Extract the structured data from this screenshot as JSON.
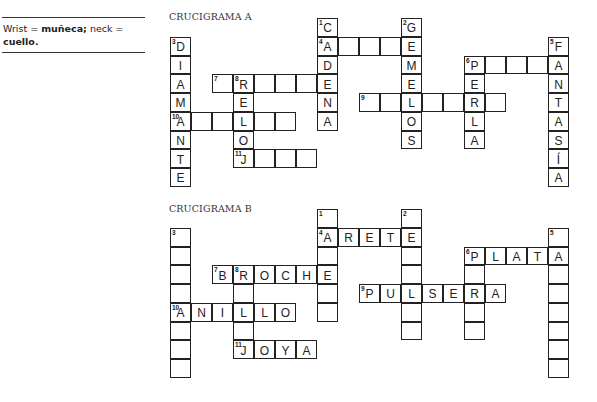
{
  "note": {
    "text_parts": [
      {
        "t": "Wrist = ",
        "bold": false
      },
      {
        "t": "muñeca;",
        "bold": true
      },
      {
        "t": " neck = ",
        "bold": false
      },
      {
        "t": "cuello.",
        "bold": true
      }
    ]
  },
  "puzzles": [
    {
      "title": "CRUCIGRAMA A",
      "title_top": 11,
      "origin": {
        "x": 170,
        "y": 18
      },
      "cells": [
        [
          0,
          7,
          "C",
          "1"
        ],
        [
          1,
          7,
          "A",
          "4"
        ],
        [
          2,
          7,
          "D",
          ""
        ],
        [
          3,
          7,
          "E",
          ""
        ],
        [
          4,
          7,
          "N",
          ""
        ],
        [
          5,
          7,
          "A",
          ""
        ],
        [
          1,
          8,
          "",
          ""
        ],
        [
          1,
          9,
          "",
          ""
        ],
        [
          1,
          10,
          "",
          ""
        ],
        [
          0,
          11,
          "G",
          "2"
        ],
        [
          1,
          11,
          "E",
          ""
        ],
        [
          2,
          11,
          "M",
          ""
        ],
        [
          3,
          11,
          "E",
          ""
        ],
        [
          4,
          11,
          "L",
          ""
        ],
        [
          5,
          11,
          "O",
          ""
        ],
        [
          6,
          11,
          "S",
          ""
        ],
        [
          1,
          0,
          "D",
          "3"
        ],
        [
          2,
          0,
          "I",
          ""
        ],
        [
          3,
          0,
          "A",
          ""
        ],
        [
          4,
          0,
          "M",
          ""
        ],
        [
          5,
          0,
          "A",
          "10"
        ],
        [
          6,
          0,
          "N",
          ""
        ],
        [
          7,
          0,
          "T",
          ""
        ],
        [
          8,
          0,
          "E",
          ""
        ],
        [
          1,
          18,
          "F",
          "5"
        ],
        [
          2,
          18,
          "A",
          ""
        ],
        [
          3,
          18,
          "N",
          ""
        ],
        [
          4,
          18,
          "T",
          ""
        ],
        [
          5,
          18,
          "A",
          ""
        ],
        [
          6,
          18,
          "S",
          ""
        ],
        [
          7,
          18,
          "Í",
          ""
        ],
        [
          8,
          18,
          "A",
          ""
        ],
        [
          2,
          14,
          "P",
          "6"
        ],
        [
          2,
          15,
          "",
          ""
        ],
        [
          2,
          16,
          "",
          ""
        ],
        [
          2,
          17,
          "",
          ""
        ],
        [
          3,
          14,
          "E",
          ""
        ],
        [
          4,
          14,
          "R",
          ""
        ],
        [
          5,
          14,
          "L",
          ""
        ],
        [
          6,
          14,
          "A",
          ""
        ],
        [
          3,
          2,
          "",
          "7"
        ],
        [
          3,
          3,
          "R",
          "8"
        ],
        [
          3,
          4,
          "",
          ""
        ],
        [
          3,
          5,
          "",
          ""
        ],
        [
          3,
          6,
          "",
          ""
        ],
        [
          4,
          3,
          "E",
          ""
        ],
        [
          5,
          3,
          "L",
          ""
        ],
        [
          6,
          3,
          "O",
          ""
        ],
        [
          7,
          3,
          "J",
          "11"
        ],
        [
          4,
          9,
          "",
          "9"
        ],
        [
          4,
          10,
          "",
          ""
        ],
        [
          4,
          12,
          "",
          ""
        ],
        [
          4,
          13,
          "",
          ""
        ],
        [
          4,
          15,
          "",
          ""
        ],
        [
          5,
          1,
          "",
          ""
        ],
        [
          5,
          2,
          "",
          ""
        ],
        [
          5,
          4,
          "",
          ""
        ],
        [
          5,
          5,
          "",
          ""
        ],
        [
          7,
          4,
          "",
          ""
        ],
        [
          7,
          5,
          "",
          ""
        ],
        [
          7,
          6,
          "",
          ""
        ]
      ]
    },
    {
      "title": "CRUCIGRAMA B",
      "title_top": 203,
      "origin": {
        "x": 170,
        "y": 209
      },
      "cells": [
        [
          0,
          7,
          "",
          "1"
        ],
        [
          1,
          7,
          "A",
          "4"
        ],
        [
          2,
          7,
          "",
          ""
        ],
        [
          3,
          7,
          "E",
          ""
        ],
        [
          4,
          7,
          "",
          ""
        ],
        [
          5,
          7,
          "",
          ""
        ],
        [
          1,
          8,
          "R",
          ""
        ],
        [
          1,
          9,
          "E",
          ""
        ],
        [
          1,
          10,
          "T",
          ""
        ],
        [
          0,
          11,
          "",
          "2"
        ],
        [
          1,
          11,
          "E",
          ""
        ],
        [
          2,
          11,
          "",
          ""
        ],
        [
          3,
          11,
          "",
          ""
        ],
        [
          4,
          11,
          "L",
          ""
        ],
        [
          5,
          11,
          "",
          ""
        ],
        [
          6,
          11,
          "",
          ""
        ],
        [
          1,
          0,
          "",
          "3"
        ],
        [
          2,
          0,
          "",
          ""
        ],
        [
          3,
          0,
          "",
          ""
        ],
        [
          4,
          0,
          "",
          ""
        ],
        [
          5,
          0,
          "A",
          "10"
        ],
        [
          6,
          0,
          "",
          ""
        ],
        [
          7,
          0,
          "",
          ""
        ],
        [
          8,
          0,
          "",
          ""
        ],
        [
          1,
          18,
          "",
          "5"
        ],
        [
          2,
          18,
          "A",
          ""
        ],
        [
          3,
          18,
          "",
          ""
        ],
        [
          4,
          18,
          "",
          ""
        ],
        [
          5,
          18,
          "",
          ""
        ],
        [
          6,
          18,
          "",
          ""
        ],
        [
          7,
          18,
          "",
          ""
        ],
        [
          8,
          18,
          "",
          ""
        ],
        [
          2,
          14,
          "P",
          "6"
        ],
        [
          2,
          15,
          "L",
          ""
        ],
        [
          2,
          16,
          "A",
          ""
        ],
        [
          2,
          17,
          "T",
          ""
        ],
        [
          3,
          14,
          "",
          ""
        ],
        [
          4,
          14,
          "R",
          ""
        ],
        [
          5,
          14,
          "",
          ""
        ],
        [
          6,
          14,
          "",
          ""
        ],
        [
          3,
          2,
          "B",
          "7"
        ],
        [
          3,
          3,
          "R",
          "8"
        ],
        [
          3,
          4,
          "O",
          ""
        ],
        [
          3,
          5,
          "C",
          ""
        ],
        [
          3,
          6,
          "H",
          ""
        ],
        [
          4,
          3,
          "",
          ""
        ],
        [
          5,
          3,
          "L",
          ""
        ],
        [
          6,
          3,
          "",
          ""
        ],
        [
          7,
          3,
          "J",
          "11"
        ],
        [
          4,
          9,
          "P",
          "9"
        ],
        [
          4,
          10,
          "U",
          ""
        ],
        [
          4,
          12,
          "S",
          ""
        ],
        [
          4,
          13,
          "E",
          ""
        ],
        [
          4,
          15,
          "A",
          ""
        ],
        [
          5,
          1,
          "N",
          ""
        ],
        [
          5,
          2,
          "I",
          ""
        ],
        [
          5,
          4,
          "L",
          ""
        ],
        [
          5,
          5,
          "O",
          ""
        ],
        [
          7,
          4,
          "O",
          ""
        ],
        [
          7,
          5,
          "Y",
          ""
        ],
        [
          7,
          6,
          "A",
          ""
        ]
      ]
    }
  ],
  "layout": {
    "cell_w": 21,
    "cell_h": 18.75
  }
}
